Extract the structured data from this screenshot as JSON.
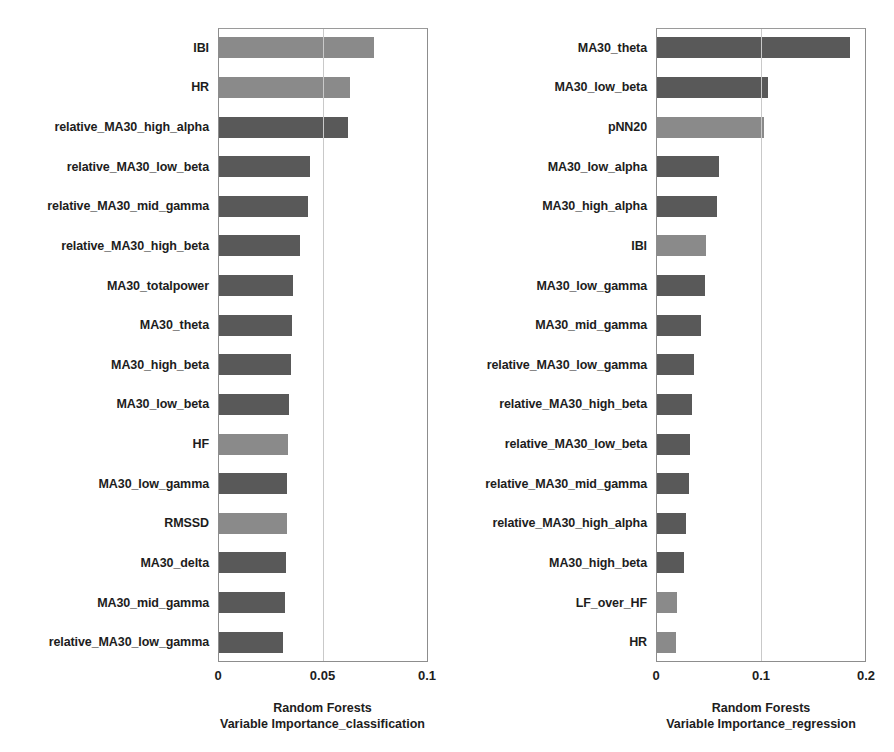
{
  "figure": {
    "background": "#ffffff",
    "bar_color_eeg": "#595959",
    "bar_color_hrv": "#8a8a8a"
  },
  "chart_data": [
    {
      "type": "bar",
      "orientation": "horizontal",
      "title": "",
      "xlabel_line1": "Random Forests",
      "xlabel_line2": "Variable Importance_classification",
      "ylabel": "",
      "xlim": [
        0,
        0.1
      ],
      "xticks": [
        0,
        0.05,
        0.1
      ],
      "xticklabels": [
        "0",
        "0.05",
        "0.1"
      ],
      "grid": false,
      "legend": "none",
      "categories": [
        "IBI",
        "HR",
        "relative_MA30_high_alpha",
        "relative_MA30_low_beta",
        "relative_MA30_mid_gamma",
        "relative_MA30_high_beta",
        "MA30_totalpower",
        "MA30_theta",
        "MA30_high_beta",
        "MA30_low_beta",
        "HF",
        "MA30_low_gamma",
        "RMSSD",
        "MA30_delta",
        "MA30_mid_gamma",
        "relative_MA30_low_gamma"
      ],
      "values": [
        0.0745,
        0.063,
        0.062,
        0.044,
        0.043,
        0.039,
        0.0355,
        0.035,
        0.0348,
        0.034,
        0.0335,
        0.033,
        0.0328,
        0.0325,
        0.032,
        0.031
      ],
      "shades": [
        "hrv",
        "hrv",
        "eeg",
        "eeg",
        "eeg",
        "eeg",
        "eeg",
        "eeg",
        "eeg",
        "eeg",
        "hrv",
        "eeg",
        "hrv",
        "eeg",
        "eeg",
        "eeg"
      ]
    },
    {
      "type": "bar",
      "orientation": "horizontal",
      "title": "",
      "xlabel_line1": "Random Forests",
      "xlabel_line2": "Variable Importance_regression",
      "ylabel": "",
      "xlim": [
        0,
        0.2
      ],
      "xticks": [
        0,
        0.1,
        0.2
      ],
      "xticklabels": [
        "0",
        "0.1",
        "0.2"
      ],
      "grid": false,
      "legend": "none",
      "categories": [
        "MA30_theta",
        "MA30_low_beta",
        "pNN20",
        "MA30_low_alpha",
        "MA30_high_alpha",
        "IBI",
        "MA30_low_gamma",
        "MA30_mid_gamma",
        "relative_MA30_low_gamma",
        "relative_MA30_high_beta",
        "relative_MA30_low_beta",
        "relative_MA30_mid_gamma",
        "relative_MA30_high_alpha",
        "MA30_high_beta",
        "LF_over_HF",
        "HR"
      ],
      "values": [
        0.185,
        0.107,
        0.103,
        0.06,
        0.058,
        0.048,
        0.047,
        0.043,
        0.036,
        0.034,
        0.032,
        0.031,
        0.029,
        0.027,
        0.02,
        0.019
      ],
      "shades": [
        "eeg",
        "eeg",
        "hrv",
        "eeg",
        "eeg",
        "hrv",
        "eeg",
        "eeg",
        "eeg",
        "eeg",
        "eeg",
        "eeg",
        "eeg",
        "eeg",
        "hrv",
        "hrv"
      ]
    }
  ]
}
